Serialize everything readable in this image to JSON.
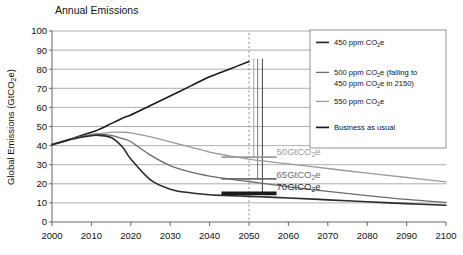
{
  "chart_data": {
    "type": "line",
    "title": "Annual Emissions",
    "xlabel": "",
    "ylabel": "Global Emissions (GtCO₂e)",
    "ylabel_main": "Global Emissions (GtCO",
    "ylabel_sub": "2",
    "ylabel_tail": "e)",
    "xlim": [
      2000,
      2100
    ],
    "ylim": [
      0,
      100
    ],
    "grid": "horizontal",
    "legend_position": "right",
    "xticks": [
      "2000",
      "2010",
      "2020",
      "2030",
      "2040",
      "2050",
      "2060",
      "2070",
      "2080",
      "2090",
      "2100"
    ],
    "yticks": [
      "0",
      "10",
      "20",
      "30",
      "40",
      "50",
      "60",
      "70",
      "80",
      "90",
      "100"
    ],
    "x": [
      2000,
      2005,
      2010,
      2012,
      2015,
      2018,
      2020,
      2025,
      2030,
      2035,
      2040,
      2045,
      2050,
      2055,
      2060,
      2070,
      2080,
      2090,
      2100
    ],
    "series": [
      {
        "name": "Business as usual",
        "color": "#1a1a1a",
        "width": 1.6,
        "values": [
          40.5,
          43.5,
          47.0,
          48.5,
          51.5,
          54.5,
          56.0,
          61.0,
          66.0,
          71.0,
          76.0,
          80.0,
          84.0,
          null,
          null,
          null,
          null,
          null,
          null
        ],
        "end_x": 2050,
        "end_value": 84.0
      },
      {
        "name": "550 ppm CO₂e",
        "color": "#9a9a9a",
        "width": 1.3,
        "values": [
          40.5,
          43.5,
          45.8,
          46.3,
          46.9,
          47.0,
          46.7,
          44.6,
          42.0,
          39.3,
          36.6,
          34.6,
          32.9,
          31.6,
          30.4,
          28.0,
          25.6,
          23.3,
          21.0
        ]
      },
      {
        "name": "500 ppm CO₂e (falling to 450 ppm CO₂e in 2150)",
        "color": "#6b6b6b",
        "width": 1.3,
        "values": [
          40.5,
          43.6,
          45.6,
          45.9,
          45.4,
          43.6,
          42.0,
          35.0,
          29.5,
          26.2,
          24.0,
          22.5,
          21.2,
          19.8,
          18.5,
          16.0,
          13.8,
          11.8,
          10.2
        ]
      },
      {
        "name": "450 ppm CO₂e",
        "color": "#2b2b2b",
        "width": 1.6,
        "values": [
          40.5,
          43.4,
          45.2,
          45.3,
          44.2,
          39.0,
          33.0,
          22.0,
          17.2,
          15.3,
          14.3,
          13.8,
          13.4,
          13.0,
          12.6,
          11.6,
          10.6,
          9.6,
          8.8
        ]
      }
    ],
    "annotations": [
      {
        "label_main": "50GtCO",
        "label_sub": "2",
        "label_tail": "e",
        "x": 2057,
        "y": 36.5,
        "color": "#9a9a9a",
        "marker": {
          "x0": 2043,
          "x1": 2057,
          "y": 34.0,
          "color": "#9a9a9a",
          "width": 1.8
        }
      },
      {
        "label_main": "65GtCO",
        "label_sub": "2",
        "label_tail": "e",
        "x": 2057,
        "y": 24.5,
        "color": "#6b6b6b",
        "marker": {
          "x0": 2043,
          "x1": 2057,
          "y": 22.6,
          "color": "#6b6b6b",
          "width": 1.8
        }
      },
      {
        "label_main": "70GtCO",
        "label_sub": "2",
        "label_tail": "e",
        "x": 2057,
        "y": 18.5,
        "color": "#2b2b2b",
        "marker": {
          "x0": 2043,
          "x1": 2057,
          "y": 15.0,
          "color": "#1a1a1a",
          "width": 3.6
        }
      }
    ],
    "reference_lines": [
      {
        "name": "year-2050-marker",
        "x": 2050,
        "style": "dashed",
        "color": "#8c8c8c"
      },
      {
        "name": "vertical-tick-a",
        "x": 2051.2,
        "style": "solid",
        "color": "#9a9a9a",
        "y_top": 85.5,
        "y_bottom": 34.0
      },
      {
        "name": "vertical-tick-b",
        "x": 2052.2,
        "style": "solid",
        "color": "#6b6b6b",
        "y_top": 85.5,
        "y_bottom": 22.6
      },
      {
        "name": "vertical-tick-c",
        "x": 2053.4,
        "style": "solid",
        "color": "#2b2b2b",
        "y_top": 85.5,
        "y_bottom": 15.0
      }
    ],
    "legend": [
      {
        "label": "450 ppm CO₂e",
        "main": "450 ppm CO",
        "sub": "2",
        "tail": "e",
        "color": "#2b2b2b",
        "line2": null
      },
      {
        "label": "500 ppm CO₂e (falling to 450 ppm CO₂e in 2150)",
        "main": "500 ppm CO",
        "sub": "2",
        "tail": "e (falling to",
        "color": "#6b6b6b",
        "line2_main": "450 ppm CO",
        "line2_sub": "2",
        "line2_tail": "e in 2150)"
      },
      {
        "label": "550 ppm CO₂e",
        "main": "550 ppm CO",
        "sub": "2",
        "tail": "e",
        "color": "#9a9a9a",
        "line2": null
      },
      {
        "label": "Business as usual",
        "main": "Business as usual",
        "sub": "",
        "tail": "",
        "color": "#1a1a1a",
        "line2": null
      }
    ]
  }
}
